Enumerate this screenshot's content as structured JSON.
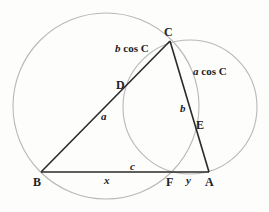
{
  "diagram": {
    "points": {
      "A": {
        "label": "A",
        "x": 209,
        "y": 172
      },
      "B": {
        "label": "B",
        "x": 41,
        "y": 172
      },
      "C": {
        "label": "C",
        "x": 170,
        "y": 41
      },
      "D": {
        "label": "D",
        "x": 126,
        "y": 85
      },
      "E": {
        "label": "E",
        "x": 195,
        "y": 125
      },
      "F": {
        "label": "F",
        "x": 170,
        "y": 172
      }
    },
    "side_labels": {
      "a": "a",
      "b": "b",
      "c": "c",
      "x": "x",
      "y": "y"
    },
    "arc_labels": {
      "b_cos_c": {
        "italic": "b",
        "rest": " cos C"
      },
      "a_cos_c": {
        "italic": "a",
        "rest": " cos C"
      }
    },
    "circles": [
      {
        "name": "large-circle",
        "cx": 106,
        "cy": 106,
        "r": 93
      },
      {
        "name": "small-circle",
        "cx": 190,
        "cy": 107,
        "r": 67
      }
    ],
    "colors": {
      "circle_stroke": "#b8b8b8",
      "triangle_stroke": "#2a2a2a",
      "text": "#222222"
    }
  }
}
